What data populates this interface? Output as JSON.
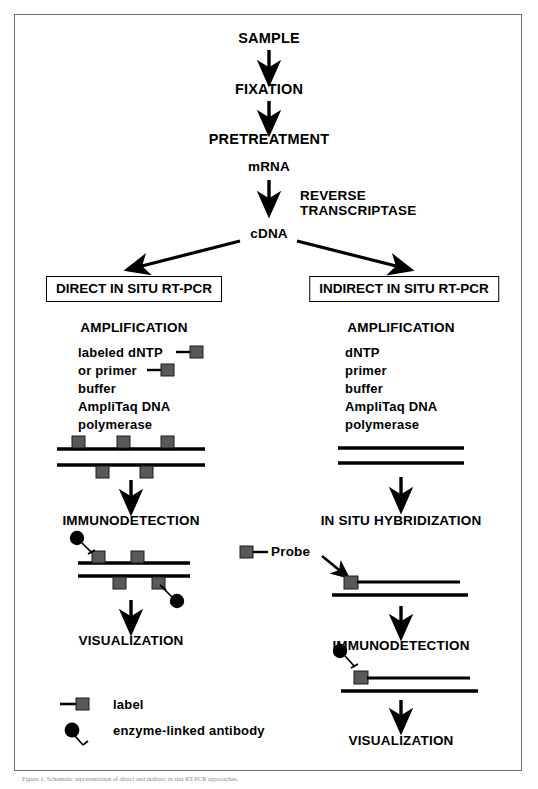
{
  "figure": {
    "title_flow": "Direct and indirect in situ RT-PCR workflow",
    "caption": "Figure 1. Schematic representation of direct and indirect in situ RT-PCR approaches."
  },
  "colors": {
    "line": "#000000",
    "label_square": "#595959",
    "antibody": "#000000",
    "frame": "#6e6e6e"
  },
  "trunk": {
    "sample": "SAMPLE",
    "fixation": "FIXATION",
    "pretreatment": "PRETREATMENT",
    "mrna": "mRNA",
    "reverse": "REVERSE",
    "transcriptase": "TRANSCRIPTASE",
    "cdna": "cDNA"
  },
  "left_branch": {
    "header": "DIRECT IN SITU RT-PCR",
    "step_amplification": "AMPLIFICATION",
    "reagents": [
      "labeled dNTP",
      "or primer",
      "buffer",
      "AmpliTaq DNA",
      "polymerase"
    ],
    "step_immunodetection": "IMMUNODETECTION",
    "step_visualization": "VISUALIZATION"
  },
  "right_branch": {
    "header": "INDIRECT IN SITU RT-PCR",
    "step_amplification": "AMPLIFICATION",
    "reagents": [
      "dNTP",
      "primer",
      "buffer",
      "AmpliTaq DNA",
      "polymerase"
    ],
    "step_hybridization": "IN SITU HYBRIDIZATION",
    "probe_label": "Probe",
    "step_immunodetection": "IMMUNODETECTION",
    "step_visualization": "VISUALIZATION"
  },
  "legend": {
    "items": [
      {
        "symbol": "label-square",
        "text": "label"
      },
      {
        "symbol": "antibody",
        "text": "enzyme-linked antibody"
      }
    ]
  }
}
